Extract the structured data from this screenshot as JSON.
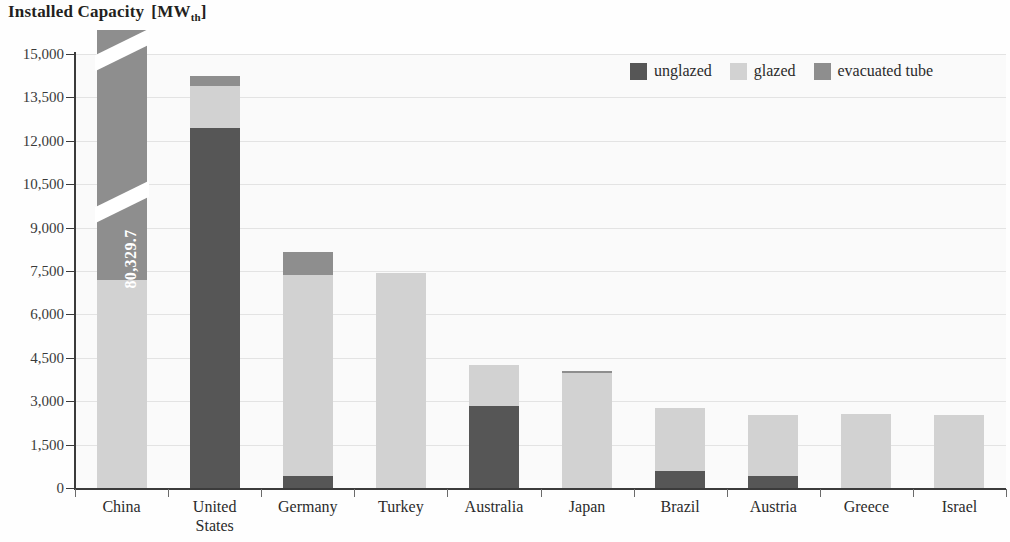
{
  "title": {
    "main": "Installed Capacity",
    "unit_prefix": "[MW",
    "unit_sub": "th",
    "unit_suffix": "]"
  },
  "legend": {
    "items": [
      {
        "label": "unglazed",
        "color": "#565656"
      },
      {
        "label": "glazed",
        "color": "#d2d2d2"
      },
      {
        "label": "evacuated tube",
        "color": "#8e8e8e"
      }
    ]
  },
  "axis": {
    "y_ticks": [
      "15,000",
      "13,500",
      "12,000",
      "10,500",
      "9,000",
      "7,500",
      "6,000",
      "4,500",
      "3,000",
      "1,500",
      "0"
    ]
  },
  "china_break_label": "80,329.7",
  "chart_data": {
    "type": "bar",
    "subtitle": "",
    "xlabel": "",
    "ylabel": "Installed Capacity [MWth]",
    "ylim": [
      0,
      15000
    ],
    "ytick_interval": 1500,
    "grid": true,
    "stacked": true,
    "legend_position": "top-right",
    "broken_axis": true,
    "broken_axis_note": "China bar is truncated; its total is annotated as 80,329.7 MWth",
    "categories": [
      "China",
      "United States",
      "Germany",
      "Turkey",
      "Australia",
      "Japan",
      "Brazil",
      "Austria",
      "Greece",
      "Israel"
    ],
    "series": [
      {
        "name": "unglazed",
        "color": "#565656",
        "values": [
          0,
          12450,
          420,
          0,
          2850,
          0,
          600,
          420,
          0,
          0
        ]
      },
      {
        "name": "glazed",
        "color": "#d2d2d2",
        "values": [
          7200,
          1430,
          6950,
          7430,
          1400,
          3980,
          2180,
          2100,
          2560,
          2530
        ]
      },
      {
        "name": "evacuated tube",
        "color": "#8e8e8e",
        "values": [
          73130,
          370,
          780,
          0,
          0,
          60,
          0,
          0,
          0,
          0
        ]
      }
    ],
    "totals": [
      80329.7,
      14250,
      8150,
      7430,
      4250,
      4040,
      2780,
      2520,
      2560,
      2530
    ],
    "displayed_totals_note": "China drawn clipped at plot top with axis break"
  }
}
